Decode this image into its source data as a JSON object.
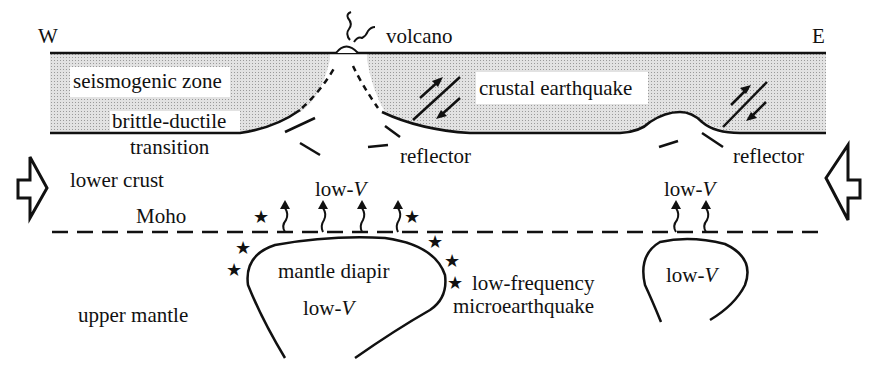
{
  "diagram": {
    "type": "geologic-cross-section",
    "orientation": {
      "west": "W",
      "east": "E"
    },
    "labels": {
      "volcano": "volcano",
      "seismogenic_zone": "seismogenic zone",
      "crustal_earthquake": "crustal earthquake",
      "brittle_ductile": "brittle-ductile",
      "transition": "transition",
      "reflector_left": "reflector",
      "reflector_right": "reflector",
      "lower_crust": "lower crust",
      "moho": "Moho",
      "low_v_prefix": "low-",
      "low_v_symbol": "V",
      "mantle_diapir": "mantle diapir",
      "low_frequency": "low-frequency",
      "microearthquake": "microearthquake",
      "upper_mantle": "upper mantle"
    },
    "colors": {
      "line": "#111111",
      "seismogenic_fill": "#d9d9d9",
      "background": "#ffffff"
    }
  }
}
